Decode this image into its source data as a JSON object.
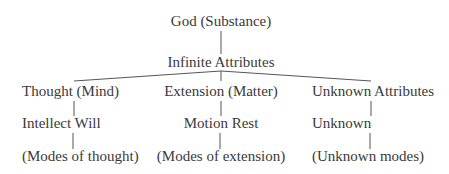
{
  "diagram": {
    "type": "tree",
    "root": {
      "id": "god",
      "label": "God (Substance)",
      "children": [
        {
          "id": "attributes",
          "label": "Infinite Attributes",
          "children": [
            {
              "id": "thought",
              "label": "Thought (Mind)",
              "children": [
                {
                  "id": "thought-modes-infinite",
                  "label": "Intellect Will",
                  "children": [
                    {
                      "id": "thought-modes",
                      "label": "(Modes of thought)"
                    }
                  ]
                }
              ]
            },
            {
              "id": "extension",
              "label": "Extension (Matter)",
              "children": [
                {
                  "id": "extension-modes-infinite",
                  "label": "Motion Rest",
                  "children": [
                    {
                      "id": "extension-modes",
                      "label": "(Modes of extension)"
                    }
                  ]
                }
              ]
            },
            {
              "id": "unknown-attr",
              "label": "Unknown Attributes",
              "children": [
                {
                  "id": "unknown-infinite",
                  "label": "Unknown",
                  "children": [
                    {
                      "id": "unknown-modes",
                      "label": "(Unknown modes)"
                    }
                  ]
                }
              ]
            }
          ]
        }
      ]
    }
  },
  "labels": {
    "god": "God (Substance)",
    "attributes": "Infinite Attributes",
    "thought": "Thought (Mind)",
    "extension": "Extension (Matter)",
    "unknown_attr": "Unknown Attributes",
    "intellect_will": "Intellect Will",
    "motion_rest": "Motion Rest",
    "unknown": "Unknown",
    "modes_thought": "(Modes of thought)",
    "modes_extension": "(Modes of extension)",
    "unknown_modes": "(Unknown modes)"
  }
}
